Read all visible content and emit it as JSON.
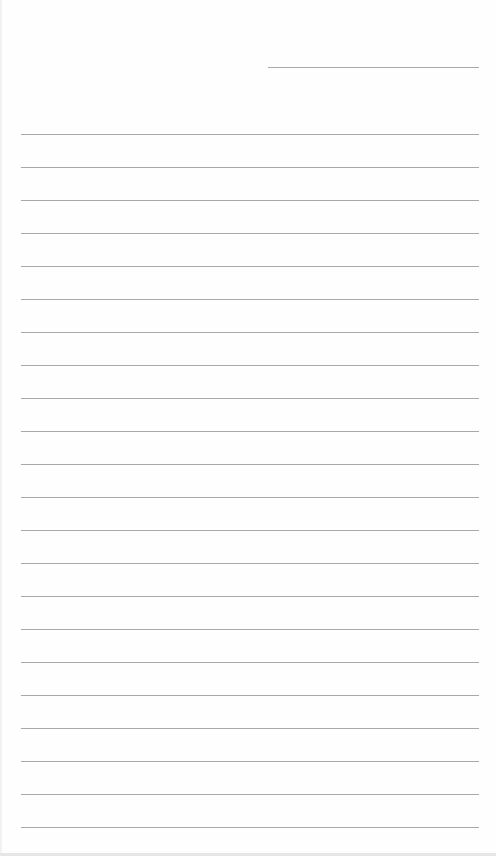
{
  "sheet": {
    "type": "lined-notepaper",
    "background_color": "#fefefe",
    "line_color": "#a9a9a9",
    "header_line": {
      "x1": 268,
      "x2": 479,
      "y": 67
    },
    "ruled_lines": {
      "count": 22,
      "x1": 21,
      "x2": 479,
      "first_y": 134,
      "spacing": 33
    }
  }
}
